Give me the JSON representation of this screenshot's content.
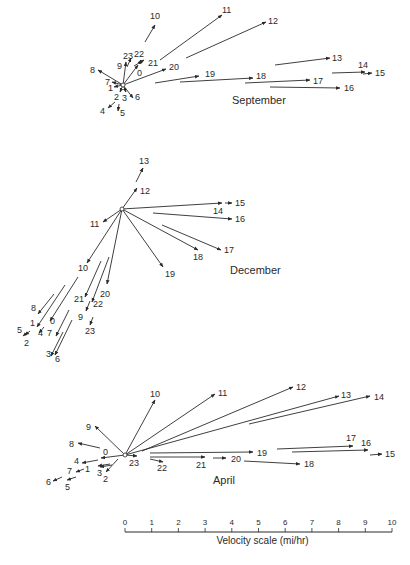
{
  "figure": {
    "panels": [
      {
        "title": "September",
        "title_pos": [
          232,
          104
        ],
        "origin": [
          123,
          85
        ],
        "vectors": [
          {
            "hour": "0",
            "x1": 123,
            "y1": 85,
            "x2": 138,
            "y2": 65,
            "lx": 137,
            "ly": 76
          },
          {
            "hour": "1",
            "x1": 123,
            "y1": 85,
            "x2": 114,
            "y2": 87,
            "lx": 108,
            "ly": 91
          },
          {
            "hour": "2",
            "x1": 123,
            "y1": 85,
            "x2": 120,
            "y2": 92,
            "lx": 114,
            "ly": 100
          },
          {
            "hour": "3",
            "x1": 123,
            "y1": 85,
            "x2": 126,
            "y2": 92,
            "lx": 122,
            "ly": 101
          },
          {
            "hour": "4",
            "x1": 115,
            "y1": 102,
            "x2": 108,
            "y2": 108,
            "lx": 100,
            "ly": 114
          },
          {
            "hour": "5",
            "x1": 119,
            "y1": 104,
            "x2": 118,
            "y2": 111,
            "lx": 120,
            "ly": 116
          },
          {
            "hour": "6",
            "x1": 123,
            "y1": 85,
            "x2": 133,
            "y2": 98,
            "lx": 135,
            "ly": 100
          },
          {
            "hour": "7",
            "x1": 123,
            "y1": 85,
            "x2": 112,
            "y2": 82,
            "lx": 105,
            "ly": 85
          },
          {
            "hour": "8",
            "x1": 123,
            "y1": 85,
            "x2": 98,
            "y2": 70,
            "lx": 90,
            "ly": 73
          },
          {
            "hour": "9",
            "x1": 123,
            "y1": 85,
            "x2": 126,
            "y2": 62,
            "lx": 117,
            "ly": 69
          },
          {
            "hour": "10",
            "x1": 145,
            "y1": 42,
            "x2": 155,
            "y2": 25,
            "lx": 150,
            "ly": 19
          },
          {
            "hour": "11",
            "x1": 160,
            "y1": 60,
            "x2": 222,
            "y2": 15,
            "lx": 222,
            "ly": 13
          },
          {
            "hour": "12",
            "x1": 186,
            "y1": 58,
            "x2": 266,
            "y2": 22,
            "lx": 268,
            "ly": 24
          },
          {
            "hour": "13",
            "x1": 275,
            "y1": 65,
            "x2": 330,
            "y2": 58,
            "lx": 332,
            "ly": 61
          },
          {
            "hour": "14",
            "x1": 332,
            "y1": 73,
            "x2": 365,
            "y2": 72,
            "lx": 358,
            "ly": 68
          },
          {
            "hour": "15",
            "x1": 363,
            "y1": 74,
            "x2": 372,
            "y2": 73,
            "lx": 375,
            "ly": 76
          },
          {
            "hour": "16",
            "x1": 270,
            "y1": 87,
            "x2": 340,
            "y2": 88,
            "lx": 344,
            "ly": 91
          },
          {
            "hour": "17",
            "x1": 245,
            "y1": 83,
            "x2": 310,
            "y2": 80,
            "lx": 313,
            "ly": 84
          },
          {
            "hour": "18",
            "x1": 180,
            "y1": 82,
            "x2": 253,
            "y2": 78,
            "lx": 256,
            "ly": 79
          },
          {
            "hour": "19",
            "x1": 155,
            "y1": 83,
            "x2": 199,
            "y2": 76,
            "lx": 205,
            "ly": 77
          },
          {
            "hour": "20",
            "x1": 123,
            "y1": 85,
            "x2": 166,
            "y2": 69,
            "lx": 169,
            "ly": 70
          },
          {
            "hour": "21",
            "x1": 134,
            "y1": 66,
            "x2": 144,
            "y2": 60,
            "lx": 148,
            "ly": 66
          },
          {
            "hour": "22",
            "x1": 139,
            "y1": 64,
            "x2": 141,
            "y2": 60,
            "lx": 134,
            "ly": 57
          },
          {
            "hour": "23",
            "x1": 127,
            "y1": 67,
            "x2": 131,
            "y2": 58,
            "lx": 123,
            "ly": 59
          }
        ]
      },
      {
        "title": "December",
        "title_pos": [
          230,
          274
        ],
        "origin": [
          122,
          209
        ],
        "vectors": [
          {
            "hour": "0",
            "x1": 78,
            "y1": 277,
            "x2": 50,
            "y2": 321,
            "lx": 50,
            "ly": 324
          },
          {
            "hour": "1",
            "x1": 65,
            "y1": 285,
            "x2": 37,
            "y2": 327,
            "lx": 30,
            "ly": 326
          },
          {
            "hour": "2",
            "x1": 30,
            "y1": 331,
            "x2": 25,
            "y2": 335,
            "lx": 24,
            "ly": 346
          },
          {
            "hour": "3",
            "x1": 63,
            "y1": 332,
            "x2": 51,
            "y2": 356,
            "lx": 46,
            "ly": 357
          },
          {
            "hour": "4",
            "x1": 44,
            "y1": 327,
            "x2": 39,
            "y2": 333,
            "lx": 38,
            "ly": 336
          },
          {
            "hour": "5",
            "x1": 28,
            "y1": 332,
            "x2": 23,
            "y2": 336,
            "lx": 17,
            "ly": 333
          },
          {
            "hour": "6",
            "x1": 72,
            "y1": 320,
            "x2": 55,
            "y2": 355,
            "lx": 55,
            "ly": 362
          },
          {
            "hour": "7",
            "x1": 69,
            "y1": 310,
            "x2": 56,
            "y2": 336,
            "lx": 47,
            "ly": 336
          },
          {
            "hour": "8",
            "x1": 54,
            "y1": 294,
            "x2": 38,
            "y2": 314,
            "lx": 31,
            "ly": 311
          },
          {
            "hour": "9",
            "x1": 90,
            "y1": 301,
            "x2": 86,
            "y2": 311,
            "lx": 78,
            "ly": 320
          },
          {
            "hour": "10",
            "x1": 122,
            "y1": 209,
            "x2": 87,
            "y2": 263,
            "lx": 78,
            "ly": 271
          },
          {
            "hour": "11",
            "x1": 122,
            "y1": 209,
            "x2": 103,
            "y2": 222,
            "lx": 90,
            "ly": 227
          },
          {
            "hour": "12",
            "x1": 122,
            "y1": 209,
            "x2": 137,
            "y2": 188,
            "lx": 140,
            "ly": 194
          },
          {
            "hour": "13",
            "x1": 136,
            "y1": 182,
            "x2": 143,
            "y2": 168,
            "lx": 139,
            "ly": 164
          },
          {
            "hour": "14",
            "x1": 122,
            "y1": 209,
            "x2": 222,
            "y2": 203,
            "lx": 213,
            "ly": 214
          },
          {
            "hour": "15",
            "x1": 225,
            "y1": 203,
            "x2": 232,
            "y2": 203,
            "lx": 235,
            "ly": 206
          },
          {
            "hour": "16",
            "x1": 153,
            "y1": 213,
            "x2": 232,
            "y2": 219,
            "lx": 235,
            "ly": 222
          },
          {
            "hour": "17",
            "x1": 162,
            "y1": 225,
            "x2": 221,
            "y2": 250,
            "lx": 224,
            "ly": 253
          },
          {
            "hour": "18",
            "x1": 122,
            "y1": 209,
            "x2": 198,
            "y2": 250,
            "lx": 193,
            "ly": 260
          },
          {
            "hour": "19",
            "x1": 122,
            "y1": 209,
            "x2": 163,
            "y2": 267,
            "lx": 165,
            "ly": 277
          },
          {
            "hour": "20",
            "x1": 122,
            "y1": 209,
            "x2": 107,
            "y2": 284,
            "lx": 100,
            "ly": 297
          },
          {
            "hour": "21",
            "x1": 101,
            "y1": 261,
            "x2": 85,
            "y2": 297,
            "lx": 74,
            "ly": 302
          },
          {
            "hour": "22",
            "x1": 109,
            "y1": 257,
            "x2": 92,
            "y2": 302,
            "lx": 93,
            "ly": 307
          },
          {
            "hour": "23",
            "x1": 93,
            "y1": 317,
            "x2": 90,
            "y2": 325,
            "lx": 85,
            "ly": 334
          }
        ]
      },
      {
        "title": "April",
        "title_pos": [
          213,
          484
        ],
        "origin": [
          125,
          455
        ],
        "vectors": [
          {
            "hour": "0",
            "x1": 125,
            "y1": 455,
            "x2": 101,
            "y2": 458,
            "lx": 103,
            "ly": 455
          },
          {
            "hour": "1",
            "x1": 110,
            "y1": 464,
            "x2": 98,
            "y2": 466,
            "lx": 85,
            "ly": 472
          },
          {
            "hour": "2",
            "x1": 118,
            "y1": 459,
            "x2": 106,
            "y2": 472,
            "lx": 103,
            "ly": 482
          },
          {
            "hour": "3",
            "x1": 112,
            "y1": 465,
            "x2": 100,
            "y2": 467,
            "lx": 97,
            "ly": 476
          },
          {
            "hour": "4",
            "x1": 98,
            "y1": 460,
            "x2": 82,
            "y2": 463,
            "lx": 74,
            "ly": 464
          },
          {
            "hour": "5",
            "x1": 76,
            "y1": 477,
            "x2": 67,
            "y2": 480,
            "lx": 65,
            "ly": 490
          },
          {
            "hour": "6",
            "x1": 62,
            "y1": 477,
            "x2": 53,
            "y2": 481,
            "lx": 46,
            "ly": 485
          },
          {
            "hour": "7",
            "x1": 84,
            "y1": 469,
            "x2": 76,
            "y2": 472,
            "lx": 67,
            "ly": 474
          },
          {
            "hour": "8",
            "x1": 100,
            "y1": 448,
            "x2": 78,
            "y2": 443,
            "lx": 69,
            "ly": 447
          },
          {
            "hour": "9",
            "x1": 125,
            "y1": 455,
            "x2": 95,
            "y2": 426,
            "lx": 86,
            "ly": 430
          },
          {
            "hour": "10",
            "x1": 125,
            "y1": 455,
            "x2": 155,
            "y2": 400,
            "lx": 150,
            "ly": 397
          },
          {
            "hour": "11",
            "x1": 125,
            "y1": 455,
            "x2": 215,
            "y2": 394,
            "lx": 218,
            "ly": 396
          },
          {
            "hour": "12",
            "x1": 142,
            "y1": 451,
            "x2": 293,
            "y2": 387,
            "lx": 296,
            "ly": 390
          },
          {
            "hour": "13",
            "x1": 125,
            "y1": 455,
            "x2": 339,
            "y2": 396,
            "lx": 341,
            "ly": 398
          },
          {
            "hour": "14",
            "x1": 249,
            "y1": 424,
            "x2": 370,
            "y2": 396,
            "lx": 374,
            "ly": 400
          },
          {
            "hour": "15",
            "x1": 370,
            "y1": 455,
            "x2": 382,
            "y2": 454,
            "lx": 385,
            "ly": 457
          },
          {
            "hour": "16",
            "x1": 292,
            "y1": 452,
            "x2": 368,
            "y2": 450,
            "lx": 361,
            "ly": 446
          },
          {
            "hour": "17",
            "x1": 277,
            "y1": 449,
            "x2": 353,
            "y2": 446,
            "lx": 346,
            "ly": 441
          },
          {
            "hour": "18",
            "x1": 244,
            "y1": 461,
            "x2": 300,
            "y2": 464,
            "lx": 304,
            "ly": 467
          },
          {
            "hour": "19",
            "x1": 150,
            "y1": 453,
            "x2": 253,
            "y2": 452,
            "lx": 257,
            "ly": 456
          },
          {
            "hour": "20",
            "x1": 213,
            "y1": 458,
            "x2": 226,
            "y2": 458,
            "lx": 231,
            "ly": 462
          },
          {
            "hour": "21",
            "x1": 150,
            "y1": 457,
            "x2": 205,
            "y2": 457,
            "lx": 196,
            "ly": 468
          },
          {
            "hour": "22",
            "x1": 150,
            "y1": 459,
            "x2": 163,
            "y2": 462,
            "lx": 157,
            "ly": 471
          },
          {
            "hour": "23",
            "x1": 125,
            "y1": 455,
            "x2": 137,
            "y2": 456,
            "lx": 129,
            "ly": 466
          }
        ]
      }
    ],
    "velocity_scale": {
      "title": "Velocity scale (mi/hr)",
      "ticks": [
        "0",
        "1",
        "2",
        "3",
        "4",
        "5",
        "6",
        "7",
        "8",
        "9",
        "10"
      ],
      "x0": 125,
      "x1": 392,
      "y": 532
    },
    "colors": {
      "ink": "#2a2a2a",
      "april_title": "#7b4fa0"
    }
  }
}
